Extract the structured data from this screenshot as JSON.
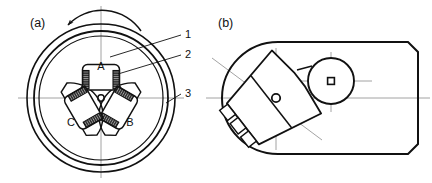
{
  "figure": {
    "panels": [
      {
        "id": "a",
        "label": "(a)",
        "caption_x": 30,
        "caption_y": 27
      },
      {
        "id": "b",
        "label": "(b)",
        "caption_x": 218,
        "caption_y": 27
      }
    ]
  },
  "panel_a": {
    "name": "cross-section-end-view",
    "center": {
      "x": 101,
      "y": 98
    },
    "outer_ring": {
      "r_outer": 74,
      "r_inner": 67,
      "r_bore": 62
    },
    "hub": {
      "r": 22,
      "pin_r": 3.2
    },
    "rotation_arrow": {
      "name": "counter-clockwise-rotation-arrow",
      "direction": "counter-clockwise"
    },
    "poles": [
      {
        "id": "A",
        "label": "A",
        "angle_deg": -90,
        "label_x": 101,
        "label_y": 66
      },
      {
        "id": "B",
        "label": "B",
        "angle_deg": 30,
        "label_x": 130,
        "label_y": 122
      },
      {
        "id": "C",
        "label": "C",
        "angle_deg": 150,
        "label_x": 71,
        "label_y": 122
      }
    ],
    "leaders": [
      {
        "id": "1",
        "label": "1",
        "label_x": 188,
        "label_y": 38,
        "target": "pole-body",
        "tip_x": 110,
        "tip_y": 57
      },
      {
        "id": "2",
        "label": "2",
        "label_x": 188,
        "label_y": 58,
        "target": "coil-winding",
        "tip_x": 118,
        "tip_y": 74
      },
      {
        "id": "3",
        "label": "3",
        "label_x": 188,
        "label_y": 97,
        "target": "outer-ring",
        "tip_x": 166,
        "tip_y": 103
      }
    ],
    "centerlines": {
      "horizontal": {
        "x1": 18,
        "x2": 184,
        "y": 98
      },
      "vertical": {
        "y1": 6,
        "y2": 178,
        "x": 101
      }
    }
  },
  "panel_b": {
    "name": "rotated-side-view",
    "housing": {
      "x": 222,
      "y": 42,
      "w": 196,
      "h": 112,
      "corner_round_left": 56,
      "corner_cut_right": 10
    },
    "pivot": {
      "x": 276,
      "y": 98,
      "r": 4.2
    },
    "wheel": {
      "x": 331,
      "y": 81,
      "r": 23,
      "hub_half": 3.4
    },
    "tilt_deg": -38,
    "coil_blocks": 3,
    "centerlines": {
      "horizontal": {
        "x1": 206,
        "x2": 430,
        "y": 98
      },
      "vertical": {
        "y1": 48,
        "y2": 150,
        "x": 276
      },
      "wheel_h": {
        "x1": 300,
        "x2": 372,
        "y": 81
      },
      "wheel_v": {
        "y1": 52,
        "y2": 112,
        "x": 331
      },
      "diagonal": {
        "x1": 212,
        "x2": 322,
        "y1": 58,
        "y2": 140
      }
    }
  },
  "style": {
    "stroke": "#111111",
    "centerline": "#8c8c8c",
    "coil_fill": "#2b2b2b",
    "background": "#ffffff"
  }
}
